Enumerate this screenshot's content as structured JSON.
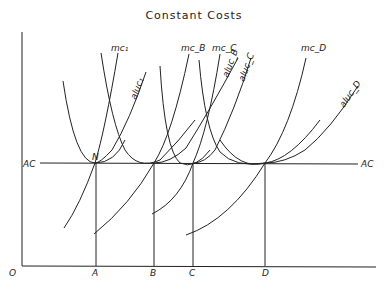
{
  "title": "Constant Costs",
  "axes": {
    "origin": "O",
    "ac_left": "AC",
    "ac_right": "AC"
  },
  "points": {
    "N": "N",
    "A": "A",
    "B": "B",
    "C": "C",
    "D": "D"
  },
  "curves": {
    "mc1": "mc₁",
    "mcB": "mc_B",
    "mcC": "mc_C",
    "mcD": "mc_D",
    "aluc1": "aluc₁",
    "alucB": "aluc_B",
    "alucC": "aluc_C",
    "alucD": "aluc_D"
  }
}
